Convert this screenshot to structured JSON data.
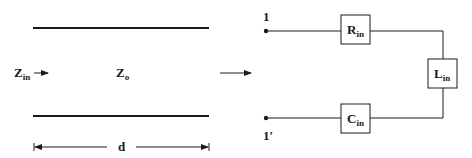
{
  "figure": {
    "left_panel": {
      "name": "transmission-line",
      "input_impedance": {
        "main": "Z",
        "sub": "in"
      },
      "characteristic_impedance": {
        "main": "Z",
        "sub": "o"
      },
      "length_label": "d"
    },
    "arrow_label": "equivalent",
    "right_panel": {
      "name": "equivalent-circuit",
      "terminal_top": "1",
      "terminal_bottom": "1′",
      "components": [
        {
          "id": "resistor",
          "main": "R",
          "sub": "in"
        },
        {
          "id": "inductor",
          "main": "L",
          "sub": "in"
        },
        {
          "id": "capacitor",
          "main": "C",
          "sub": "in"
        }
      ]
    },
    "colors": {
      "ink": "#1a1a1a",
      "background": "#ffffff"
    }
  }
}
